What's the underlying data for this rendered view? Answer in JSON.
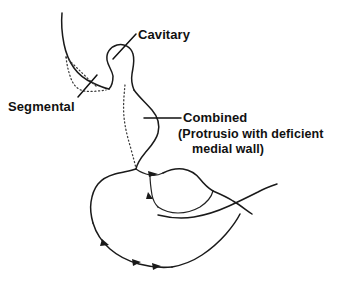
{
  "figure": {
    "background_color": "#ffffff",
    "ink_color": "#1a1a1a",
    "width": 350,
    "height": 282
  },
  "labels": {
    "segmental": "Segmental",
    "cavitary": "Cavitary",
    "combined": "Combined",
    "combined_detail_line1": "(Protrusio with deficient",
    "combined_detail_line2": "medial wall)"
  },
  "annotations": [
    {
      "name": "segmental",
      "label": "Segmental",
      "leader_from": [
        78,
        97
      ],
      "leader_to": [
        97,
        75
      ],
      "defect_style": "dotted"
    },
    {
      "name": "cavitary",
      "label": "Cavitary",
      "leader_from": [
        136,
        34
      ],
      "leader_to": [
        113,
        59
      ],
      "defect_style": "solid-contour"
    },
    {
      "name": "combined",
      "label": "Combined",
      "leader_from": [
        181,
        118
      ],
      "leader_to": [
        144,
        118
      ],
      "defect_style": "dotted"
    }
  ]
}
